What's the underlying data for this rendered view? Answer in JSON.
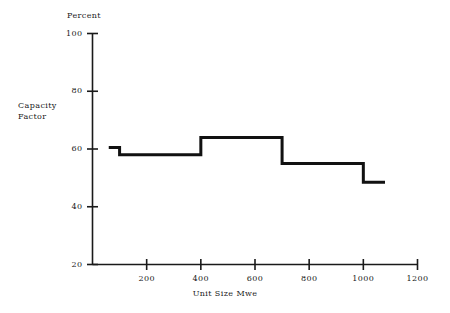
{
  "chart_data": {
    "type": "line",
    "subtype": "step",
    "title": "",
    "xlabel": "Unit Size Mwe",
    "ylabel": "Capacity Factor",
    "y_axis_unit_label": "Percent",
    "xlim": [
      0,
      1200
    ],
    "ylim": [
      20,
      100
    ],
    "grid": false,
    "legend": null,
    "xticks": [
      200,
      400,
      600,
      800,
      1000,
      1200
    ],
    "xtick_labels": [
      "200",
      "400",
      "600",
      "800",
      "1000",
      "1200"
    ],
    "yticks": [
      20,
      40,
      60,
      80,
      100
    ],
    "ytick_labels": [
      "20",
      "40",
      "60",
      "80",
      "100"
    ],
    "series": [
      {
        "name": "Capacity Factor",
        "color": "#111111",
        "line_width": 3,
        "steps": [
          {
            "x_start": 60,
            "x_end": 100,
            "value": 60.5
          },
          {
            "x_start": 100,
            "x_end": 400,
            "value": 58.0
          },
          {
            "x_start": 400,
            "x_end": 700,
            "value": 64.0
          },
          {
            "x_start": 700,
            "x_end": 1000,
            "value": 55.0
          },
          {
            "x_start": 1000,
            "x_end": 1080,
            "value": 48.5
          }
        ]
      }
    ]
  },
  "labels": {
    "percent": "Percent",
    "capacity": "Capacity",
    "factor": "Factor",
    "unit_size": "Unit Size Mwe"
  }
}
